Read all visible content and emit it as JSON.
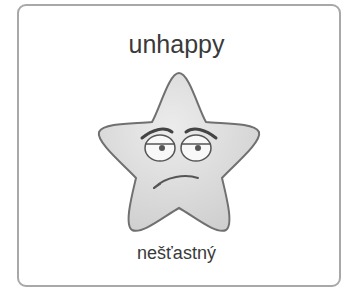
{
  "card": {
    "title": "unhappy",
    "subtitle": "nešťastný",
    "image": {
      "icon": "unhappy-star-icon",
      "fill": "#d9d9d9",
      "stroke": "#707070"
    }
  }
}
